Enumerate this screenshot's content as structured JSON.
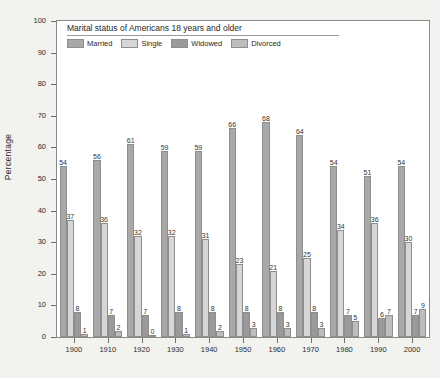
{
  "chart_data": {
    "type": "bar",
    "title": "Marital status of Americans 18 years and older",
    "xlabel": "",
    "ylabel": "Percentage",
    "ylim": [
      0,
      100
    ],
    "ytick_step": 10,
    "yticks": [
      0,
      10,
      20,
      30,
      40,
      50,
      60,
      70,
      80,
      90,
      100
    ],
    "grid": false,
    "legend_position": "top-left inside plot",
    "categories": [
      "1900",
      "1910",
      "1920",
      "1930",
      "1940",
      "1950",
      "1960",
      "1970",
      "1980",
      "1990",
      "2000"
    ],
    "series": [
      {
        "name": "Married",
        "color": "#a8a8a8",
        "values": [
          54,
          56,
          61,
          59,
          59,
          66,
          68,
          64,
          54,
          51,
          54
        ]
      },
      {
        "name": "Single",
        "color": "#d6d6d6",
        "values": [
          37,
          36,
          32,
          32,
          31,
          23,
          21,
          25,
          34,
          36,
          30
        ]
      },
      {
        "name": "Widowed",
        "color": "#9a9a9a",
        "values": [
          8,
          7,
          7,
          8,
          8,
          8,
          8,
          8,
          7,
          6,
          7
        ]
      },
      {
        "name": "Divorced",
        "color": "#bdbdbd",
        "values": [
          1,
          2,
          0,
          1,
          2,
          3,
          3,
          3,
          5,
          7,
          9
        ]
      }
    ]
  },
  "colors": {
    "figure_background": "#f2f2ef",
    "plot_background": "#ffffff",
    "axis": "#8a8a8a",
    "text": "#2b2b2b"
  }
}
